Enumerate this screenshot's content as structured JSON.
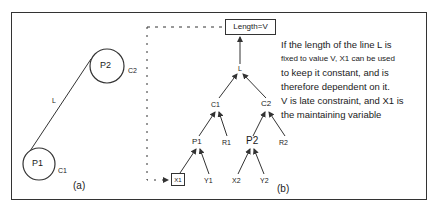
{
  "figure_a": {
    "caption": "(a)",
    "line_label": "L",
    "circle_p1": {
      "label": "P1",
      "constraint_label": "C1"
    },
    "circle_p2": {
      "label": "P2",
      "constraint_label": "C2"
    }
  },
  "figure_b": {
    "caption": "(b)",
    "root_box": "Length=V",
    "nodes": {
      "L": "L",
      "C1": "C1",
      "C2": "C2",
      "P1": "P1",
      "R1": "R1",
      "P2": "P2",
      "R2": "R2",
      "X1": "X1",
      "Y1": "Y1",
      "X2": "X2",
      "Y2": "Y2"
    }
  },
  "description": {
    "lines": [
      "If the length of the line L is",
      "fixed to value V, X1 can be used",
      "to keep it constant, and is",
      "therefore dependent on it.",
      "V is late constraint, and X1 is",
      "the maintaining variable"
    ]
  },
  "colors": {
    "stroke": "#333333",
    "background": "#ffffff"
  }
}
